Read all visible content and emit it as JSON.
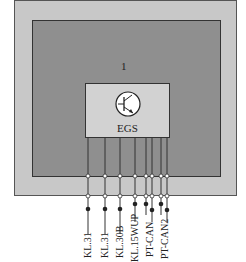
{
  "diagram": {
    "region_marker": "1",
    "module": {
      "label": "EGS",
      "icon": "transistor-icon"
    },
    "pins": [
      {
        "label": "KL.31",
        "x": 88
      },
      {
        "label": "KL.31",
        "x": 105
      },
      {
        "label": "KL.30B",
        "x": 120
      },
      {
        "label": "KL.15WUP",
        "x": 135
      },
      {
        "label": "PT-CAN",
        "x": 146
      },
      {
        "label": "PT-CAN",
        "x": 152
      },
      {
        "label": "PT-CAN2",
        "x": 161
      },
      {
        "label": "PT-CAN2",
        "x": 167
      }
    ],
    "labels_shown": [
      "KL.31",
      "KL.31",
      "KL.30B",
      "KL.15WUP",
      "PT-CAN",
      "PT-CAN2"
    ],
    "colors": {
      "outer": "#c8c8c8",
      "inner": "#8f8f8f",
      "module": "#d2d2d2",
      "line": "#333333"
    }
  }
}
